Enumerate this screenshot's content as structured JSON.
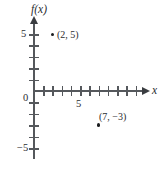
{
  "chart_data": {
    "type": "scatter",
    "title": "",
    "xlabel": "x",
    "ylabel": "f(x)",
    "xlim": [
      -1,
      11
    ],
    "ylim": [
      -6,
      6
    ],
    "grid": false,
    "legend": null,
    "origin_label": "0",
    "x_ticks": [
      1,
      2,
      3,
      4,
      5,
      6,
      7,
      8,
      9,
      10,
      11
    ],
    "x_tick_labels": [
      {
        "value": 5,
        "text": "5"
      }
    ],
    "y_ticks": [
      -5,
      -4,
      -3,
      -2,
      -1,
      1,
      2,
      3,
      4,
      5
    ],
    "y_tick_labels": [
      {
        "value": 5,
        "text": "5"
      },
      {
        "value": -5,
        "text": "−5"
      }
    ],
    "points": [
      {
        "x": 2,
        "y": 5,
        "label": "(2, 5)",
        "label_position": "right"
      },
      {
        "x": 7,
        "y": -3,
        "label": "(7, −3)",
        "label_position": "above"
      }
    ],
    "colors": {
      "axis": "#55585c",
      "point": "#1b1d1f",
      "text": "#2a2c2f",
      "background": "#ffffff"
    }
  }
}
